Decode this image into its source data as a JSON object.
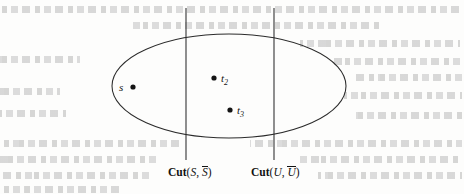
{
  "figure": {
    "type": "set-partition-diagram",
    "background_color": "#fdfdfc",
    "ink_color": "#141414"
  },
  "shapes": {
    "ellipse": {
      "name": "vertex-set-ellipse",
      "cx": 229,
      "cy": 86,
      "rx": 117,
      "ry": 52
    },
    "cut_lines": [
      {
        "name": "cut-line-s",
        "x": 186,
        "y_top": 8,
        "y_bottom": 160
      },
      {
        "name": "cut-line-u",
        "x": 274,
        "y_top": 8,
        "y_bottom": 160
      }
    ]
  },
  "nodes": [
    {
      "id": "s",
      "label": "s",
      "subscript": "",
      "label_side": "left",
      "dot_x": 133,
      "dot_y": 87,
      "label_x": 119,
      "label_y": 82
    },
    {
      "id": "t2",
      "label": "t",
      "subscript": "2",
      "label_side": "right",
      "dot_x": 214,
      "dot_y": 78,
      "label_x": 221,
      "label_y": 73
    },
    {
      "id": "t3",
      "label": "t",
      "subscript": "3",
      "label_side": "right",
      "dot_x": 230,
      "dot_y": 110,
      "label_x": 237,
      "label_y": 105
    }
  ],
  "captions": [
    {
      "name": "cut-s-caption",
      "keyword": "Cut",
      "open": "(",
      "first": "S",
      "separator": ", ",
      "second": "S",
      "second_has_overbar": true,
      "close": ")",
      "plain_text": "Cut(S, S̅)",
      "x": 168,
      "y": 166
    },
    {
      "name": "cut-u-caption",
      "keyword": "Cut",
      "open": "(",
      "first": "U",
      "separator": ", ",
      "second": "U",
      "second_has_overbar": true,
      "close": ")",
      "plain_text": "Cut(U, U̅)",
      "x": 251,
      "y": 166
    }
  ],
  "ghost_text_rows": [
    {
      "x": 2,
      "y": 6,
      "width": 458
    },
    {
      "x": 130,
      "y": 22,
      "width": 250
    },
    {
      "x": 300,
      "y": 40,
      "width": 160
    },
    {
      "x": 0,
      "y": 56,
      "width": 80
    },
    {
      "x": 330,
      "y": 58,
      "width": 130
    },
    {
      "x": 352,
      "y": 74,
      "width": 110
    },
    {
      "x": 0,
      "y": 88,
      "width": 60
    },
    {
      "x": 344,
      "y": 92,
      "width": 118
    },
    {
      "x": 0,
      "y": 110,
      "width": 66
    },
    {
      "x": 352,
      "y": 112,
      "width": 110
    },
    {
      "x": 0,
      "y": 140,
      "width": 180
    },
    {
      "x": 250,
      "y": 140,
      "width": 212
    },
    {
      "x": 0,
      "y": 156,
      "width": 160
    },
    {
      "x": 300,
      "y": 156,
      "width": 162
    },
    {
      "x": 0,
      "y": 172,
      "width": 150
    },
    {
      "x": 318,
      "y": 172,
      "width": 144
    },
    {
      "x": 2,
      "y": 186,
      "width": 120
    }
  ]
}
